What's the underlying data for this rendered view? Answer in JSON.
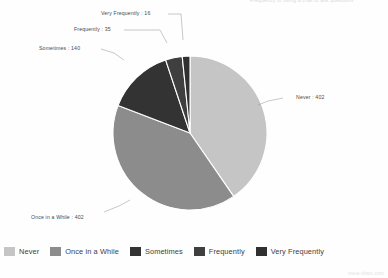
{
  "watermark": "meta-chart.com",
  "top_clipped_text": "Frequency of using a chat to ask questions",
  "chart_data": {
    "type": "pie",
    "title": "",
    "categories": [
      "Never",
      "Once in a While",
      "Sometimes",
      "Frequently",
      "Very Frequently"
    ],
    "values": [
      402,
      402,
      140,
      35,
      16
    ],
    "total": 995,
    "colors": [
      "#c5c5c5",
      "#8c8c8c",
      "#333333",
      "#3f3f3f",
      "#303030"
    ],
    "legend_position": "bottom",
    "labels_outside": true,
    "slice_labels": [
      "Never : 402",
      "Once in a While : 402",
      "Sometimes : 140",
      "Frequently : 35",
      "Very Frequently : 16"
    ],
    "start_angle_deg": 0,
    "direction": "clockwise",
    "slice_border_color": "#ffffff"
  },
  "legend": {
    "items": [
      {
        "label": "Never",
        "color": "#c5c5c5"
      },
      {
        "label": "Once in a While",
        "color": "#8c8c8c"
      },
      {
        "label": "Sometimes",
        "color": "#333333"
      },
      {
        "label": "Frequently",
        "color": "#3f3f3f"
      },
      {
        "label": "Very Frequently",
        "color": "#303030"
      }
    ]
  }
}
